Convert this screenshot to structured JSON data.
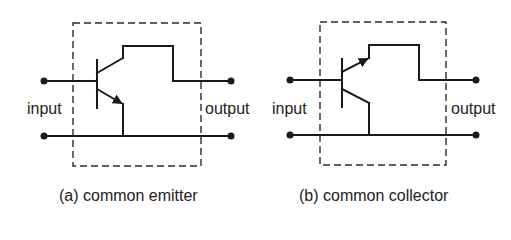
{
  "panels": [
    {
      "id": "a",
      "caption": "(a) common emitter",
      "input_label": "input",
      "output_label": "output",
      "configuration": "common emitter",
      "emitter_arrow": "outward, on lower lead to common rail"
    },
    {
      "id": "b",
      "caption": "(b) common collector",
      "input_label": "input",
      "output_label": "output",
      "configuration": "common collector",
      "emitter_arrow": "outward, on upper lead to output"
    }
  ],
  "colors": {
    "line": "#1a1a1a",
    "box_dashed": "#2a2a2a",
    "background": "#ffffff"
  }
}
